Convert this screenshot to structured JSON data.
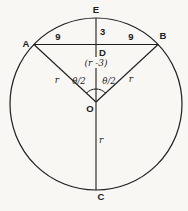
{
  "figure": {
    "type": "geometry-circle-chord-diagram",
    "background_color": "#f8f7f4",
    "line_color": "#1e1e1e",
    "points": {
      "top": "E",
      "chord_left": "A",
      "chord_right": "B",
      "bottom": "C",
      "chord_midpoint": "D",
      "center": "O"
    },
    "measures": {
      "segment_ED": "3",
      "chord_left_half": "9",
      "chord_right_half": "9",
      "segment_DO": "(r -3)",
      "radius_OA": "r",
      "radius_OB": "r",
      "radius_OC": "r",
      "angle_left": "θ/2",
      "angle_right": "θ/2"
    }
  }
}
